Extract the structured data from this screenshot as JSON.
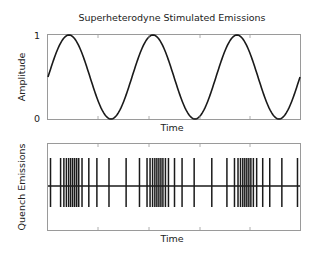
{
  "figure": {
    "title": "Superheterodyne Stimulated Emissions"
  },
  "top_plot": {
    "ylabel": "Amplitude",
    "xlabel": "Time",
    "yticks": [
      "1",
      "0"
    ]
  },
  "bottom_plot": {
    "ylabel": "Quench Emissions",
    "xlabel": "Time"
  },
  "colors": {
    "line": "#1a1a1a",
    "axes": "#9a9a9a"
  },
  "chart_data": [
    {
      "type": "line",
      "title": "Superheterodyne Stimulated Emissions",
      "xlabel": "Time",
      "ylabel": "Amplitude",
      "ylim": [
        0,
        1
      ],
      "yticks": [
        0,
        1
      ],
      "xticks_labels": [],
      "grid": false,
      "series": [
        {
          "name": "stimulus",
          "description": "sinusoid 0.5+0.5*sin, ~3 cycles, starts at 0.5 rising",
          "cycles": 3.0,
          "x": [
            0,
            0.083,
            0.167,
            0.25,
            0.333,
            0.417,
            0.5,
            0.583,
            0.667,
            0.75,
            0.833,
            0.917,
            1.0
          ],
          "values": [
            0.5,
            1.0,
            0.5,
            0.0,
            0.5,
            1.0,
            0.5,
            0.0,
            0.5,
            1.0,
            0.5,
            0.0,
            0.5
          ]
        }
      ]
    },
    {
      "type": "line",
      "title": "",
      "xlabel": "Time",
      "ylabel": "Quench Emissions",
      "grid": false,
      "description": "pulse train on a baseline; pulse density increases near each sine peak",
      "pulse_x_fraction": [
        0.01,
        0.05,
        0.063,
        0.073,
        0.082,
        0.09,
        0.098,
        0.106,
        0.114,
        0.122,
        0.135,
        0.162,
        0.194,
        0.242,
        0.31,
        0.363,
        0.393,
        0.405,
        0.415,
        0.424,
        0.432,
        0.44,
        0.448,
        0.456,
        0.466,
        0.478,
        0.502,
        0.532,
        0.58,
        0.65,
        0.71,
        0.74,
        0.754,
        0.764,
        0.773,
        0.781,
        0.789,
        0.797,
        0.805,
        0.815,
        0.828,
        0.852,
        0.88,
        0.928,
        0.99
      ]
    }
  ]
}
